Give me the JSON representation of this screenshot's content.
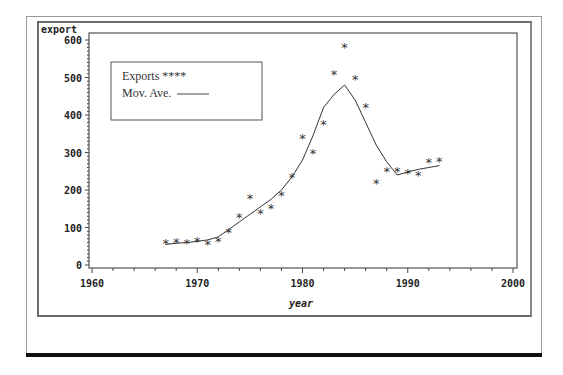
{
  "chart_data": {
    "type": "line",
    "title": "",
    "xlabel": "year",
    "ylabel": "export",
    "xlim": [
      1960,
      2000
    ],
    "ylim": [
      0,
      600
    ],
    "x_ticks": [
      1960,
      1970,
      1980,
      1990,
      2000
    ],
    "y_ticks": [
      0,
      100,
      200,
      300,
      400,
      500,
      600
    ],
    "x_tick_labels": [
      "1960",
      "1970",
      "1980",
      "1990",
      "2000"
    ],
    "y_tick_labels": [
      "0",
      "100",
      "200",
      "300",
      "400",
      "500",
      "600"
    ],
    "grid": false,
    "legend_position": "upper-left inside",
    "legend": [
      {
        "label": "Exports ****",
        "style": "scatter-asterisk"
      },
      {
        "label": "Mov. Ave. ———",
        "style": "line"
      }
    ],
    "series": [
      {
        "name": "Exports",
        "type": "scatter",
        "marker": "*",
        "x": [
          1967,
          1968,
          1969,
          1970,
          1971,
          1972,
          1973,
          1974,
          1975,
          1976,
          1977,
          1978,
          1979,
          1980,
          1981,
          1982,
          1983,
          1984,
          1985,
          1986,
          1987,
          1988,
          1989,
          1990,
          1991,
          1992,
          1993
        ],
        "values": [
          58,
          62,
          60,
          63,
          55,
          65,
          88,
          128,
          180,
          140,
          153,
          188,
          235,
          338,
          298,
          375,
          510,
          582,
          497,
          422,
          218,
          250,
          250,
          245,
          240,
          275,
          277
        ]
      },
      {
        "name": "Mov. Ave.",
        "type": "line",
        "x": [
          1967,
          1968,
          1969,
          1970,
          1971,
          1972,
          1973,
          1974,
          1975,
          1976,
          1977,
          1978,
          1979,
          1980,
          1981,
          1982,
          1983,
          1984,
          1985,
          1986,
          1987,
          1988,
          1989,
          1990,
          1991,
          1992,
          1993
        ],
        "values": [
          55,
          58,
          60,
          63,
          67,
          75,
          95,
          115,
          135,
          155,
          175,
          200,
          235,
          280,
          345,
          420,
          455,
          480,
          440,
          380,
          320,
          275,
          240,
          248,
          255,
          260,
          265
        ]
      }
    ]
  },
  "labels": {
    "y_axis_title": "export",
    "x_axis_title": "year",
    "legend_exports": "Exports ****",
    "legend_movave": "Mov. Ave."
  }
}
